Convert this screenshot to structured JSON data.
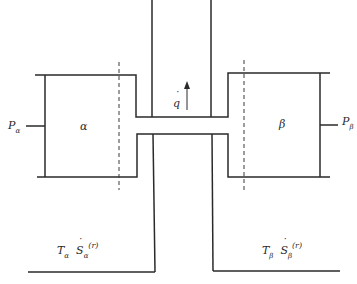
{
  "diagram": {
    "subsystems": {
      "alpha": {
        "label": "α",
        "pressure_label": "P",
        "pressure_sub": "α",
        "temp_label": "T",
        "temp_sub": "α",
        "entropy_label": "S",
        "entropy_sub": "α",
        "entropy_sup": "(r)"
      },
      "beta": {
        "label": "β",
        "pressure_label": "P",
        "pressure_sub": "β",
        "temp_label": "T",
        "temp_sub": "β",
        "entropy_label": "S",
        "entropy_sub": "β",
        "entropy_sup": "(r)"
      }
    },
    "flow": {
      "label": "q",
      "arrow_direction": "up"
    },
    "colors": {
      "line": "#2a2a2a",
      "background": "#ffffff"
    }
  }
}
